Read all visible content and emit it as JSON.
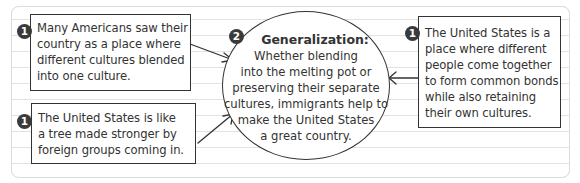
{
  "diagram": {
    "type": "graphic-organizer",
    "left_top_box": {
      "badge": "1",
      "lines": [
        "Many Americans saw their",
        "country as a place where",
        "different cultures blended",
        "into one culture."
      ]
    },
    "left_bottom_box": {
      "badge": "1",
      "lines": [
        "The United States is like",
        "a tree made stronger by",
        "foreign groups coming in."
      ]
    },
    "right_box": {
      "badge": "1",
      "lines": [
        "The United States is a",
        "place where different",
        "people come together",
        "to form common bonds",
        "while also retaining",
        "their own cultures."
      ]
    },
    "center_circle": {
      "badge": "2",
      "heading": "Generalization:",
      "lines": [
        "Whether blending",
        "into the melting pot or",
        "preserving their separate",
        "cultures, immigrants help to",
        "make the United States",
        "a great country."
      ]
    },
    "colors": {
      "stroke": "#333333",
      "badge_fill": "#3a3a3a",
      "rule_lines": "#e2e2e2",
      "card_border": "#dcdcdc"
    }
  }
}
